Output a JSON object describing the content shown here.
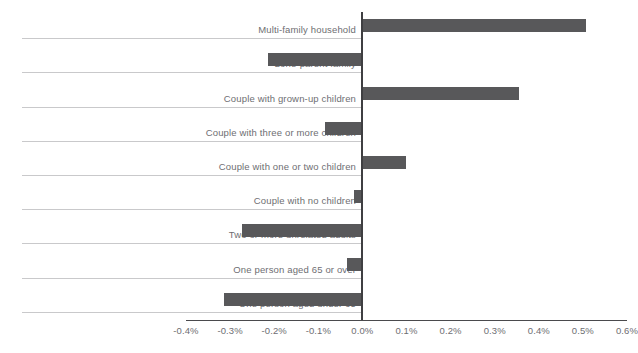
{
  "chart_data": {
    "type": "bar",
    "orientation": "horizontal",
    "title": "",
    "subtitle": "",
    "xlabel": "",
    "ylabel": "",
    "xlim": [
      -0.4,
      0.6
    ],
    "xtick_values": [
      -0.4,
      -0.3,
      -0.2,
      -0.1,
      0.0,
      0.1,
      0.2,
      0.3,
      0.4,
      0.5,
      0.6
    ],
    "xtick_labels": [
      "-0.4%",
      "-0.3%",
      "-0.2%",
      "-0.1%",
      "0.0%",
      "0.1%",
      "0.2%",
      "0.3%",
      "0.4%",
      "0.5%",
      "0.6%"
    ],
    "grid": false,
    "legend": "none",
    "bar_color": "#58585a",
    "categories": [
      "Multi-family household",
      "Lone-parent family",
      "Couple with grown-up children",
      "Couple with three or more children",
      "Couple with one or two children",
      "Couple with no children",
      "Two or more unrelated adults",
      "One person aged 65 or over",
      "One person aged under 65"
    ],
    "values": [
      0.506,
      -0.213,
      0.354,
      -0.084,
      0.1,
      -0.02,
      -0.272,
      -0.034,
      -0.313
    ],
    "value_labels": [
      "0.51%",
      "-0.21%",
      "0.35%",
      "-0.08%",
      "0.10%",
      "-0.02%",
      "-0.27%",
      "-0.03%",
      "-0.31%"
    ]
  },
  "axis": {
    "zero_label": "0.0%"
  }
}
